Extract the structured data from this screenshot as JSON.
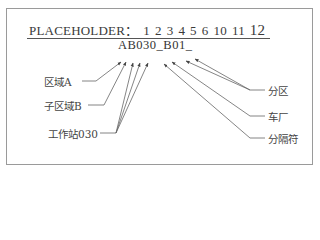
{
  "title": {
    "prefix": "PLACEHOLDER：",
    "numbers": [
      "1",
      "2",
      "3",
      "4",
      "5",
      "6",
      "10",
      "11",
      "12"
    ]
  },
  "code": "AB030_B01_",
  "labels_left": [
    {
      "id": "area",
      "text": "区域A"
    },
    {
      "id": "subarea",
      "text": "子区域B"
    },
    {
      "id": "workstation",
      "text": "工作站030"
    }
  ],
  "labels_right": [
    {
      "id": "partition",
      "text": "分区"
    },
    {
      "id": "workshop",
      "text": "车厂"
    },
    {
      "id": "separator",
      "text": "分隔符"
    }
  ],
  "colors": {
    "line": "#555555",
    "frame": "#9a9a9a",
    "text": "#333333"
  }
}
